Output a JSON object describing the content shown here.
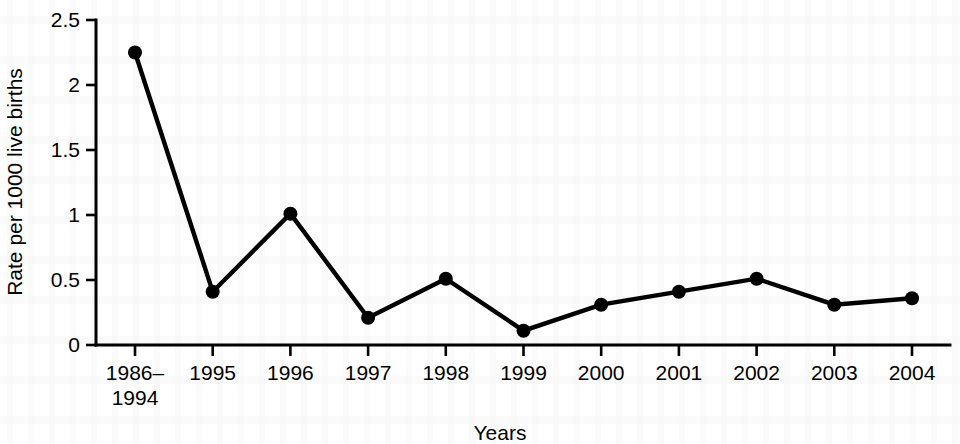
{
  "chart_data": {
    "type": "line",
    "title": "",
    "subtitle": "",
    "xlabel": "Years",
    "ylabel": "Rate per 1000 live births",
    "categories": [
      "1986–\n1994",
      "1995",
      "1996",
      "1997",
      "1998",
      "1999",
      "2000",
      "2001",
      "2002",
      "2003",
      "2004"
    ],
    "category_labels": [
      {
        "line1": "1986–",
        "line2": "1994"
      },
      {
        "line1": "1995",
        "line2": ""
      },
      {
        "line1": "1996",
        "line2": ""
      },
      {
        "line1": "1997",
        "line2": ""
      },
      {
        "line1": "1998",
        "line2": ""
      },
      {
        "line1": "1999",
        "line2": ""
      },
      {
        "line1": "2000",
        "line2": ""
      },
      {
        "line1": "2001",
        "line2": ""
      },
      {
        "line1": "2002",
        "line2": ""
      },
      {
        "line1": "2003",
        "line2": ""
      },
      {
        "line1": "2004",
        "line2": ""
      }
    ],
    "values": [
      2.25,
      0.41,
      1.01,
      0.21,
      0.51,
      0.11,
      0.31,
      0.41,
      0.51,
      0.31,
      0.36
    ],
    "ylim": [
      0,
      2.5
    ],
    "yticks": [
      0,
      0.5,
      1,
      1.5,
      2,
      2.5
    ],
    "ytick_labels": [
      "0",
      "0.5",
      "1",
      "1.5",
      "2",
      "2.5"
    ],
    "grid": false,
    "legend": "none",
    "marker": "filled-circle",
    "line_color": "#000000",
    "marker_color": "#000000",
    "background_color": "#ffffff"
  },
  "figure": {
    "width": 960,
    "height": 444
  }
}
